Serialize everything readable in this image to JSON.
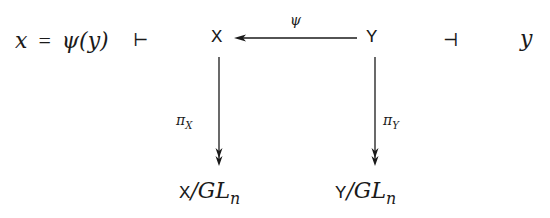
{
  "left_expression": {
    "lhs": "x",
    "equals": "=",
    "rhs": "ψ(y)"
  },
  "turnstile_left": "⊢",
  "turnstile_right": "⊣",
  "right_variable": "y",
  "nodes": {
    "top_left": "X",
    "top_right": "Y",
    "bottom_left_space": "X",
    "bottom_left_group": "/GL",
    "bottom_left_sub": "n",
    "bottom_right_space": "Y",
    "bottom_right_group": "/GL",
    "bottom_right_sub": "n"
  },
  "arrows": {
    "top": {
      "label": "ψ",
      "from": "Y",
      "to": "X"
    },
    "left": {
      "label_main": "π",
      "label_sub": "X",
      "from": "X",
      "to": "X/GL_n",
      "style": "two-headed"
    },
    "right": {
      "label_main": "π",
      "label_sub": "Y",
      "from": "Y",
      "to": "Y/GL_n",
      "style": "two-headed"
    }
  },
  "colors": {
    "ink": "#1a1a1a",
    "background": "#ffffff"
  }
}
